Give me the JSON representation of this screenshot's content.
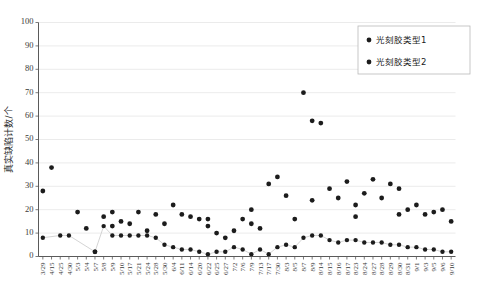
{
  "chart_data": {
    "type": "scatter",
    "title": "",
    "xlabel": "",
    "ylabel": "真实缺陷计数/个",
    "ylim": [
      0,
      100
    ],
    "ytick_values": [
      0,
      10,
      20,
      30,
      40,
      50,
      60,
      70,
      80,
      90,
      100
    ],
    "grid": true,
    "legend_position": "top-right",
    "categories": [
      "3/29",
      "4/15",
      "4/25",
      "4/30",
      "5/3",
      "5/4",
      "5/7",
      "5/8",
      "5/9",
      "5/10",
      "5/17",
      "5/21",
      "5/24",
      "5/28",
      "5/30",
      "6/4",
      "6/11",
      "6/14",
      "6/20",
      "6/22",
      "6/25",
      "6/27",
      "7/2",
      "7/6",
      "7/9",
      "7/13",
      "7/17",
      "7/30",
      "8/3",
      "8/5",
      "8/7",
      "8/9",
      "8/14",
      "8/15",
      "8/16",
      "8/17",
      "8/23",
      "8/24",
      "8/27",
      "8/28",
      "8/29",
      "8/30",
      "8/31",
      "9/1",
      "9/3",
      "9/5",
      "9/6",
      "9/10"
    ],
    "series": [
      {
        "name": "光刻胶类型1",
        "color": "#1c1c1c",
        "values": [
          28,
          38,
          null,
          null,
          19,
          12,
          2,
          17,
          13,
          15,
          14,
          19,
          11,
          18,
          14,
          22,
          18,
          17,
          16,
          13,
          10,
          8,
          11,
          16,
          14,
          12,
          31,
          34,
          26,
          16,
          70,
          58,
          57,
          29,
          25,
          32,
          22,
          27,
          33,
          25,
          31,
          29,
          20,
          22,
          18,
          19,
          20,
          15
        ]
      },
      {
        "name": "光刻胶类型2",
        "color": "#1c1c1c",
        "values": [
          8,
          null,
          9,
          9,
          null,
          null,
          2,
          13,
          9,
          9,
          9,
          9,
          9,
          8,
          5,
          4,
          3,
          3,
          2,
          1,
          2,
          2,
          4,
          3,
          1,
          3,
          1,
          4,
          5,
          4,
          8,
          9,
          9,
          7,
          6,
          7,
          7,
          6,
          6,
          6,
          5,
          5,
          4,
          4,
          3,
          3,
          2,
          2
        ]
      }
    ],
    "legend_entries": [
      "光刻胶类型1",
      "光刻胶类型2"
    ],
    "extra_points_series1": [
      {
        "x": 8,
        "y": 19
      },
      {
        "x": 19,
        "y": 16
      },
      {
        "x": 24,
        "y": 20
      },
      {
        "x": 31,
        "y": 24
      },
      {
        "x": 36,
        "y": 17
      },
      {
        "x": 41,
        "y": 18
      }
    ]
  },
  "legend": {
    "marker_icon": "dot-marker",
    "items": [
      {
        "label": "光刻胶类型1"
      },
      {
        "label": "光刻胶类型2"
      }
    ]
  },
  "axes": {
    "y_axis_title": "真实缺陷计数/个",
    "y_ticks": [
      "0",
      "10",
      "20",
      "30",
      "40",
      "50",
      "60",
      "70",
      "80",
      "90",
      "100"
    ]
  }
}
